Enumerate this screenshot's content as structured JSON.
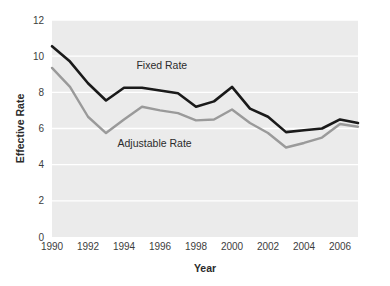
{
  "chart_data": {
    "type": "line",
    "title": "",
    "xlabel": "Year",
    "ylabel": "Effective Rate",
    "x": [
      1990,
      1991,
      1992,
      1993,
      1994,
      1995,
      1996,
      1997,
      1998,
      1999,
      2000,
      2001,
      2002,
      2003,
      2004,
      2005,
      2006,
      2007
    ],
    "xlim": [
      1990,
      2007
    ],
    "ylim": [
      0,
      12
    ],
    "xticks": [
      1990,
      1992,
      1994,
      1996,
      1998,
      2000,
      2002,
      2004,
      2006
    ],
    "xtick_labels": [
      "1990",
      "1992",
      "1994",
      "1996",
      "1998",
      "2000",
      "2002",
      "2004",
      "2006"
    ],
    "yticks": [
      0,
      2,
      4,
      6,
      8,
      10,
      12
    ],
    "ytick_labels": [
      "0",
      "2",
      "4",
      "6",
      "8",
      "10",
      "12"
    ],
    "grid": "horizontal",
    "legend_position": "inline-annotation",
    "plot_background": "#ebebeb",
    "gridline_color": "#ffffff",
    "series": [
      {
        "name": "Fixed Rate",
        "color": "#1a1a1a",
        "values": [
          10.55,
          9.7,
          8.5,
          7.55,
          8.25,
          8.25,
          8.1,
          7.95,
          7.2,
          7.5,
          8.3,
          7.1,
          6.65,
          5.8,
          5.9,
          6.0,
          6.5,
          6.3
        ],
        "label_x": 1996.1,
        "label_y": 9.3
      },
      {
        "name": "Adjustable Rate",
        "color": "#9a9a9a",
        "values": [
          9.35,
          8.3,
          6.65,
          5.75,
          6.5,
          7.2,
          7.0,
          6.85,
          6.45,
          6.5,
          7.05,
          6.3,
          5.75,
          4.95,
          5.2,
          5.5,
          6.25,
          6.1
        ],
        "label_x": 1995.7,
        "label_y": 5.0
      }
    ]
  }
}
